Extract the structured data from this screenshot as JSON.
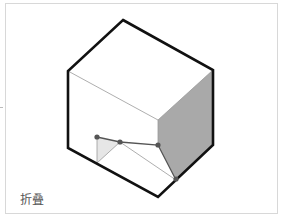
{
  "figure": {
    "label": "折叠",
    "colors": {
      "outline": "#111111",
      "inner_line": "#999999",
      "shaded_face": "#a9a9a9",
      "fold_flap": "#e6e6e6",
      "fold_line": "#555555",
      "point": "#555555",
      "frame": "#d8d8d8"
    },
    "cube_outline_points": "123,20 213,70 213,145 158,197 68,148 68,71",
    "inner_edges": [
      {
        "x1": 68,
        "y1": 71,
        "x2": 158,
        "y2": 120
      },
      {
        "x1": 158,
        "y1": 120,
        "x2": 213,
        "y2": 70
      },
      {
        "x1": 158,
        "y1": 120,
        "x2": 158,
        "y2": 145
      }
    ],
    "shaded_face_points": "158,120 213,70 213,145 176,180 158,145",
    "fold_flap_points": "97,137 120,142 97,163",
    "fold_path_points": "97,137 120,142 158,145 176,180",
    "fold_crease": [
      {
        "x1": 120,
        "y1": 142,
        "x2": 176,
        "y2": 180
      },
      {
        "x1": 97,
        "y1": 137,
        "x2": 97,
        "y2": 163
      },
      {
        "x1": 120,
        "y1": 142,
        "x2": 97,
        "y2": 163
      }
    ],
    "points": [
      {
        "cx": 97,
        "cy": 137
      },
      {
        "cx": 120,
        "cy": 142
      },
      {
        "cx": 158,
        "cy": 145
      },
      {
        "cx": 176,
        "cy": 179
      }
    ]
  }
}
